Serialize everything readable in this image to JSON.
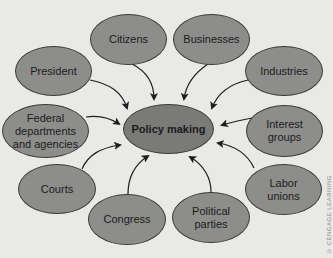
{
  "diagram": {
    "center": {
      "label": "Policy making"
    },
    "nodes": [
      {
        "id": "citizens",
        "label": "Citizens"
      },
      {
        "id": "businesses",
        "label": "Businesses"
      },
      {
        "id": "president",
        "label": "President"
      },
      {
        "id": "industries",
        "label": "Industries"
      },
      {
        "id": "federal",
        "label": "Federal departments and agencies",
        "line1": "Federal",
        "line2": "departments",
        "line3": "and agencies"
      },
      {
        "id": "interest",
        "label": "Interest groups",
        "line1": "Interest",
        "line2": "groups"
      },
      {
        "id": "courts",
        "label": "Courts"
      },
      {
        "id": "labor",
        "label": "Labor unions",
        "line1": "Labor",
        "line2": "unions"
      },
      {
        "id": "congress",
        "label": "Congress"
      },
      {
        "id": "parties",
        "label": "Political parties",
        "line1": "Political",
        "line2": "parties"
      }
    ],
    "edges": [
      {
        "from": "citizens",
        "to": "center"
      },
      {
        "from": "businesses",
        "to": "center"
      },
      {
        "from": "president",
        "to": "center"
      },
      {
        "from": "industries",
        "to": "center"
      },
      {
        "from": "federal",
        "to": "center"
      },
      {
        "from": "interest",
        "to": "center"
      },
      {
        "from": "courts",
        "to": "center"
      },
      {
        "from": "labor",
        "to": "center"
      },
      {
        "from": "congress",
        "to": "center"
      },
      {
        "from": "parties",
        "to": "center"
      }
    ],
    "copyright": "© CENGAGE LEARNING",
    "colors": {
      "node_fill": "#8d8d8b",
      "center_fill": "#7a7a78",
      "stroke": "#3a3a3a",
      "background": "#e9e9e7"
    }
  }
}
